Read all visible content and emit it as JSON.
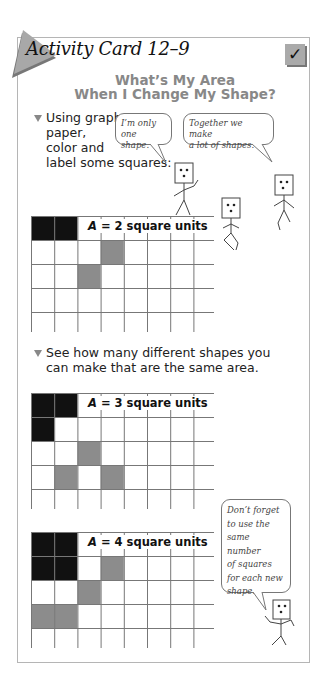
{
  "card": {
    "title": "Activity Card 12–9",
    "checkmark": "✓",
    "heading_line1": "What’s My Area",
    "heading_line2": "When I Change My Shape?"
  },
  "instructions": [
    {
      "lines": [
        "Using graph",
        "paper,",
        "color and",
        "label some squares:"
      ]
    },
    {
      "lines": [
        "See how many different shapes you",
        "can make that are the same area."
      ]
    }
  ],
  "speech_bubbles": [
    {
      "lines": [
        "I’m only",
        "one shape."
      ]
    },
    {
      "lines": [
        "Together we make",
        "a lot of shapes."
      ]
    },
    {
      "lines": [
        "Don’t forget",
        "to use the",
        "same number",
        "of squares",
        "for each new",
        "shape."
      ]
    }
  ],
  "grids": [
    {
      "area_var": "A",
      "label": " = 2 square units",
      "black": [
        [
          0,
          0
        ],
        [
          0,
          1
        ]
      ],
      "gray": [
        [
          1,
          3
        ],
        [
          2,
          2
        ]
      ],
      "top": 216
    },
    {
      "area_var": "A",
      "label": " = 3 square units",
      "black": [
        [
          0,
          0
        ],
        [
          0,
          1
        ],
        [
          1,
          0
        ]
      ],
      "gray": [
        [
          2,
          2
        ],
        [
          3,
          1
        ],
        [
          3,
          3
        ]
      ],
      "top": 393
    },
    {
      "area_var": "A",
      "label": " = 4 square units",
      "black": [
        [
          0,
          0
        ],
        [
          0,
          1
        ],
        [
          1,
          0
        ],
        [
          1,
          1
        ]
      ],
      "gray": [
        [
          1,
          3
        ],
        [
          2,
          2
        ],
        [
          3,
          0
        ],
        [
          3,
          1
        ]
      ],
      "top": 532
    }
  ],
  "colors": {
    "black_cell": "#111111",
    "gray_cell": "#8c8c8c",
    "grid_line": "#777777",
    "heading": "#888888",
    "triangle": "#a8a8a8"
  }
}
